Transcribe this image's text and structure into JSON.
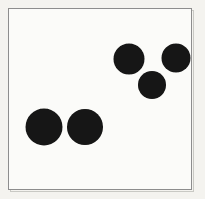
{
  "figure": {
    "title": "Dot pattern figure",
    "description": "Five solid black filled circles on a light background inside a thin rectangular border",
    "width": 205,
    "height": 199,
    "background_color": "#f4f3ef",
    "page_color": "#ffffff"
  },
  "frame": {
    "name": "border-rectangle",
    "x": 8.5,
    "y": 8.5,
    "width": 183,
    "height": 181,
    "stroke_color": "#8d8d8d",
    "stroke_width": 1,
    "fill_color": "#fbfbf9",
    "shadow_color": "#c9c9c4",
    "shadow_offset": 2
  },
  "chart_data": {
    "type": "scatter",
    "title": "Dot pattern figure",
    "xlabel": "",
    "ylabel": "",
    "xlim": [
      8,
      192
    ],
    "ylim": [
      8,
      190
    ],
    "grid": false,
    "legend": null,
    "marker": "filled-circle",
    "marker_color": "#121212",
    "point_count": 5,
    "groups": [
      {
        "name": "lower-left-pair",
        "count": 2,
        "label": "two large dots, lower left"
      },
      {
        "name": "upper-right-triad",
        "count": 3,
        "label": "three dots in triangle, upper right"
      }
    ],
    "points": [
      {
        "id": "dot-1",
        "group": "lower-left-pair",
        "cx": 44,
        "cy": 127,
        "r": 18.5,
        "color": "#131313"
      },
      {
        "id": "dot-2",
        "group": "lower-left-pair",
        "cx": 85,
        "cy": 127,
        "r": 18.0,
        "color": "#131313"
      },
      {
        "id": "dot-3",
        "group": "upper-right-triad",
        "cx": 129,
        "cy": 59,
        "r": 15.5,
        "color": "#131313"
      },
      {
        "id": "dot-4",
        "group": "upper-right-triad",
        "cx": 176,
        "cy": 58,
        "r": 14.5,
        "color": "#131313"
      },
      {
        "id": "dot-5",
        "group": "upper-right-triad",
        "cx": 152,
        "cy": 85,
        "r": 14.0,
        "color": "#131313"
      }
    ]
  }
}
